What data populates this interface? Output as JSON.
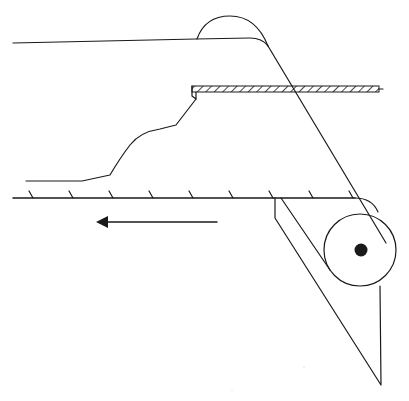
{
  "diagram": {
    "type": "technical-line-drawing",
    "colors": {
      "stroke": "#1a1a1a",
      "background": "#ffffff"
    },
    "elements": {
      "upper_belt": "upper belt line",
      "hump": "semicircular hump on upper belt",
      "inclined_belt": "inclined belt descending to roller",
      "hatched_plate": "hatched horizontal plate",
      "material_profile": "material surface profile",
      "ground_line": "hatched ground/base line",
      "direction_arrow": "arrow pointing left (motion direction)",
      "roller": "roller drum with axle",
      "scraper": "triangular scraper/blade"
    },
    "ground_hatch_count": 9,
    "arrow_direction": "left"
  }
}
